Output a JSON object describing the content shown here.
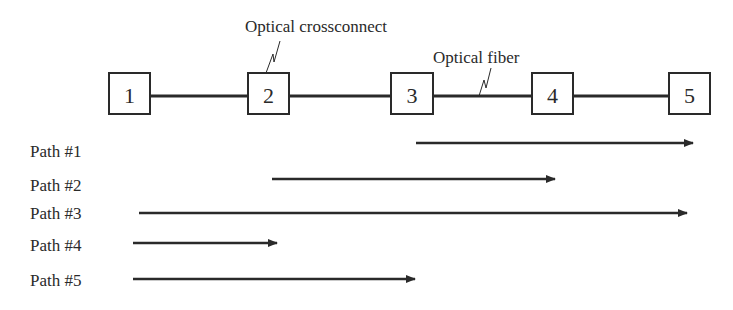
{
  "diagram": {
    "colors": {
      "stroke": "#2a2a2a",
      "background": "#ffffff"
    },
    "nodes": [
      {
        "id": "1",
        "label": "1",
        "x": 109,
        "y": 73,
        "w": 41,
        "h": 41
      },
      {
        "id": "2",
        "label": "2",
        "x": 248,
        "y": 73,
        "w": 41,
        "h": 41
      },
      {
        "id": "3",
        "label": "3",
        "x": 391,
        "y": 73,
        "w": 42,
        "h": 41
      },
      {
        "id": "4",
        "label": "4",
        "x": 532,
        "y": 73,
        "w": 41,
        "h": 41
      },
      {
        "id": "5",
        "label": "5",
        "x": 669,
        "y": 73,
        "w": 41,
        "h": 41
      }
    ],
    "links_y": 96,
    "callouts": {
      "crossconnect": {
        "label": "Optical crossconnect",
        "x": 245,
        "y": 32
      },
      "fiber": {
        "label": "Optical fiber",
        "x": 433,
        "y": 63
      }
    },
    "paths": [
      {
        "label": "Path #1",
        "label_y": 157,
        "y": 143,
        "x1": 416,
        "x2": 693
      },
      {
        "label": "Path #2",
        "label_y": 191,
        "y": 179,
        "x1": 272,
        "x2": 555
      },
      {
        "label": "Path #3",
        "label_y": 219,
        "y": 213,
        "x1": 139,
        "x2": 687
      },
      {
        "label": "Path #4",
        "label_y": 251,
        "y": 243,
        "x1": 133,
        "x2": 277
      },
      {
        "label": "Path #5",
        "label_y": 286,
        "y": 279,
        "x1": 133,
        "x2": 415
      }
    ]
  }
}
